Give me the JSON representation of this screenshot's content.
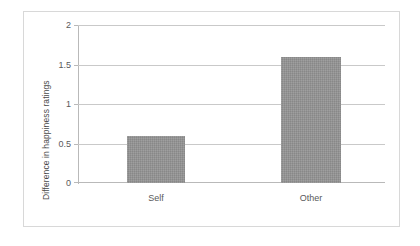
{
  "chart_data": {
    "type": "bar",
    "title": "",
    "xlabel": "",
    "ylabel": "Difference in happiness ratings",
    "categories": [
      "Self",
      "Other"
    ],
    "values": [
      0.6,
      1.6
    ],
    "ylim": [
      0,
      2
    ],
    "yticks": [
      "0",
      "0.5",
      "1",
      "1.5",
      "2"
    ],
    "ytick_values": [
      0,
      0.5,
      1,
      1.5,
      2
    ],
    "grid": true,
    "legend": false,
    "series": [
      {
        "name": "Difference in happiness ratings",
        "values": [
          0.6,
          1.6
        ]
      }
    ],
    "colors": {
      "bar_fill": "#949494",
      "gridline": "#c9c9c9",
      "axis": "#b9b9b9",
      "frame": "#d8d8d8",
      "text": "#59595b",
      "background": "#ffffff"
    }
  }
}
